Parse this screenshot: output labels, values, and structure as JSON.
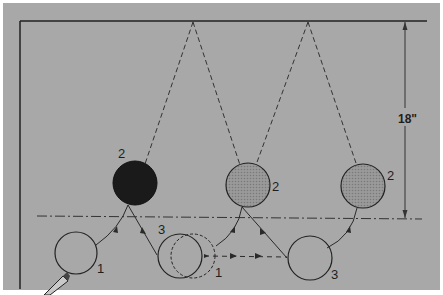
{
  "diagram": {
    "dimension_label": "18\"",
    "labels": {
      "ball_black_pos": "2",
      "ball_gray1_pos": "2",
      "ball_gray2_pos": "2",
      "start_ball_pos": "1",
      "middle_ball_pos3": "3",
      "middle_ball_pos1": "1",
      "end_ball_pos": "3"
    },
    "colors": {
      "background": "#a8a8a8",
      "line": "#2a2a2a",
      "ball_black": "#1a1a1a",
      "ball_gray": "#8e8e8e"
    }
  }
}
